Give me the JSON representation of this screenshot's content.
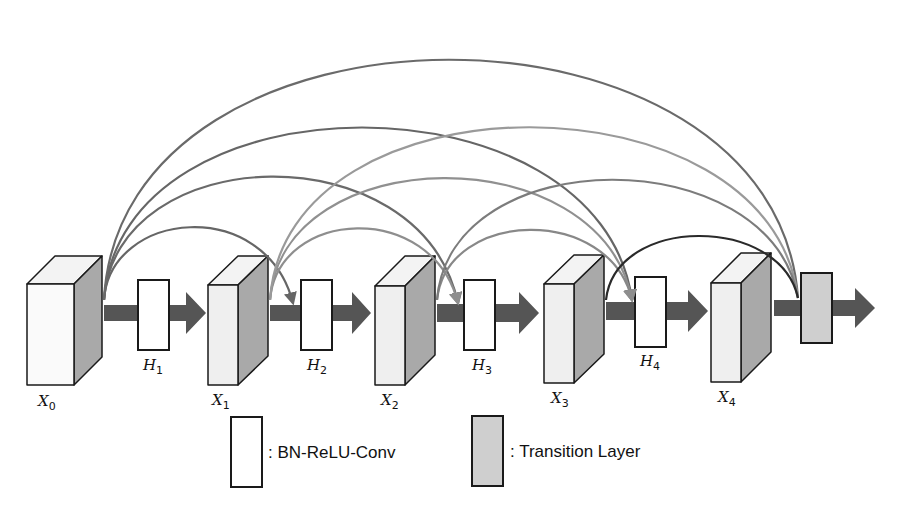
{
  "diagram": {
    "title": "",
    "colors": {
      "background": "#ffffff",
      "cube_front": "#efefef",
      "cube_front_x0": "#fafafa",
      "cube_top": "#f3f3f3",
      "cube_side": "#a9a9a9",
      "outline": "#1a1a1a",
      "flow_arrow": "#555555",
      "conv_block": "#ffffff",
      "transition_block": "#cfcfcf",
      "arc_dark": "#666666",
      "arc_mid": "#888888",
      "arc_light": "#9e9e9e",
      "arc_black": "#2a2a2a"
    },
    "feature_maps": [
      {
        "id": "X0",
        "var": "X",
        "sub": "0"
      },
      {
        "id": "X1",
        "var": "X",
        "sub": "1"
      },
      {
        "id": "X2",
        "var": "X",
        "sub": "2"
      },
      {
        "id": "X3",
        "var": "X",
        "sub": "3"
      },
      {
        "id": "X4",
        "var": "X",
        "sub": "4"
      }
    ],
    "layers": [
      {
        "id": "H1",
        "var": "H",
        "sub": "1",
        "type": "BN-ReLU-Conv"
      },
      {
        "id": "H2",
        "var": "H",
        "sub": "2",
        "type": "BN-ReLU-Conv"
      },
      {
        "id": "H3",
        "var": "H",
        "sub": "3",
        "type": "BN-ReLU-Conv"
      },
      {
        "id": "H4",
        "var": "H",
        "sub": "4",
        "type": "BN-ReLU-Conv"
      },
      {
        "id": "T",
        "type": "Transition Layer"
      }
    ],
    "dense_connections": [
      {
        "from": "X0",
        "to": "H2"
      },
      {
        "from": "X0",
        "to": "H3"
      },
      {
        "from": "X0",
        "to": "H4"
      },
      {
        "from": "X0",
        "to": "T"
      },
      {
        "from": "X1",
        "to": "H3"
      },
      {
        "from": "X1",
        "to": "H4"
      },
      {
        "from": "X1",
        "to": "T"
      },
      {
        "from": "X2",
        "to": "H4"
      },
      {
        "from": "X2",
        "to": "T"
      },
      {
        "from": "X3",
        "to": "T"
      }
    ],
    "legend": [
      {
        "swatch": "white",
        "label": ": BN-ReLU-Conv"
      },
      {
        "swatch": "gray",
        "label": ": Transition Layer"
      }
    ]
  }
}
